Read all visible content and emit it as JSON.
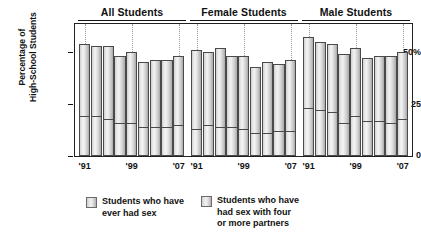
{
  "chart_data": {
    "type": "bar",
    "subtype": "stacked-bar-grouped",
    "title": "",
    "xlabel": "",
    "ylabel": "Percentage of High-School Students",
    "ylim": [
      0,
      60
    ],
    "yticks": [
      0,
      25,
      50
    ],
    "ytick_labels": [
      "0",
      "25",
      "50%"
    ],
    "grid": "dotted vertical gridlines at '91, '99 and '07",
    "legend_position": "below-plot",
    "panels": [
      {
        "label": "All Students",
        "x": [
          "'91",
          "'93",
          "'95",
          "'97",
          "'99",
          "'01",
          "'03",
          "'05",
          "'07"
        ],
        "series": [
          {
            "name": "Students who have ever had sex",
            "values": [
              54,
              53,
              53,
              48,
              50,
              45,
              46,
              46,
              48
            ]
          },
          {
            "name": "Students who have had sex with four or more partners",
            "values": [
              19,
              19,
              18,
              16,
              16,
              14,
              14,
              14,
              15
            ]
          }
        ]
      },
      {
        "label": "Female Students",
        "x": [
          "'91",
          "'93",
          "'95",
          "'97",
          "'99",
          "'01",
          "'03",
          "'05",
          "'07"
        ],
        "series": [
          {
            "name": "Students who have ever had sex",
            "values": [
              51,
              50,
              52,
              48,
              48,
              43,
              45,
              44,
              46
            ]
          },
          {
            "name": "Students who have had sex with four or more partners",
            "values": [
              13,
              15,
              14,
              14,
              13,
              11,
              11,
              12,
              12
            ]
          }
        ]
      },
      {
        "label": "Male Students",
        "x": [
          "'91",
          "'93",
          "'95",
          "'97",
          "'99",
          "'01",
          "'03",
          "'05",
          "'07"
        ],
        "series": [
          {
            "name": "Students who have ever had sex",
            "values": [
              57,
              55,
              54,
              49,
              52,
              47,
              48,
              48,
              50
            ]
          },
          {
            "name": "Students who have had sex with four or more partners",
            "values": [
              23,
              22,
              21,
              16,
              19,
              17,
              17,
              16,
              18
            ]
          }
        ]
      }
    ],
    "xtick_shown": [
      "'91",
      "'99",
      "'07"
    ],
    "legend": [
      "Students who have\never had sex",
      "Students who have\nhad sex with four\nor more partners"
    ]
  },
  "axis": {
    "y_title_line1": "Percentage of",
    "y_title_line2": "High-School Students",
    "ytick_top": "50%",
    "ytick_mid": "25",
    "ytick_zero": "0"
  },
  "groups": [
    {
      "title": "All Students",
      "ticks": [
        "'91",
        "'99",
        "'07"
      ]
    },
    {
      "title": "Female Students",
      "ticks": [
        "'91",
        "'99",
        "'07"
      ]
    },
    {
      "title": "Male Students",
      "ticks": [
        "'91",
        "'99",
        "'07"
      ]
    }
  ],
  "legend": {
    "item1": "Students who have\never had sex",
    "item2": "Students who have\nhad sex with four\nor more partners"
  },
  "colors": {
    "bar_light": "#f2f2f2",
    "bar_mid": "#d2d2d2",
    "bar_dark": "#a9a9a9",
    "outline": "#4a4a4a",
    "axis": "#222222",
    "gridline": "#9a9a9a",
    "text": "#111111"
  }
}
